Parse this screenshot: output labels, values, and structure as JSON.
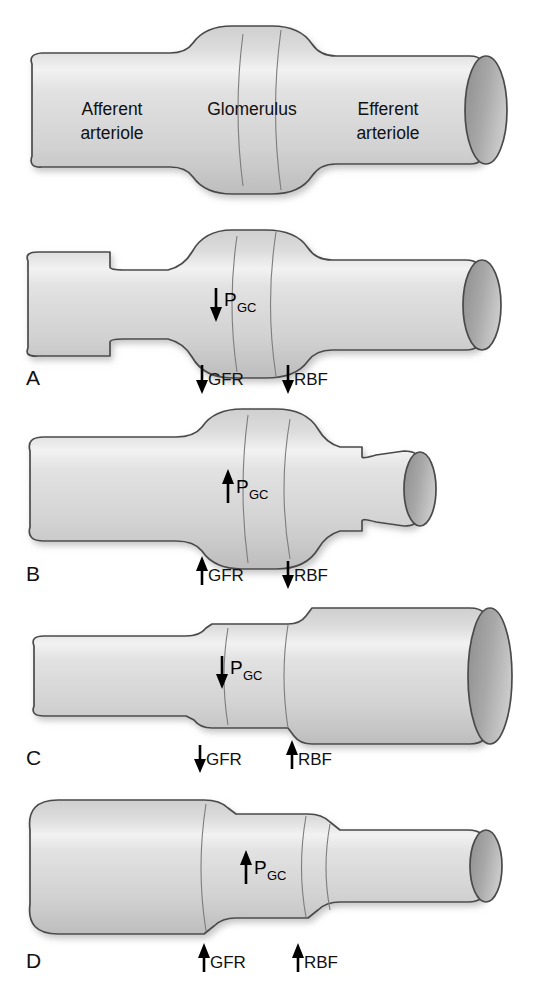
{
  "figure": {
    "background_color": "#ffffff",
    "vessel_fill_light": "#e6e6e6",
    "vessel_fill_mid": "#cfcfcf",
    "vessel_fill_dark": "#a9a9a9",
    "lumen_fill": "#9a9a9a",
    "outline_color": "#4a4a4a",
    "text_color": "#111111"
  },
  "top_panel": {
    "labels": {
      "afferent_line1": "Afferent",
      "afferent_line2": "arteriole",
      "glomerulus": "Glomerulus",
      "efferent_line1": "Efferent",
      "efferent_line2": "arteriole"
    }
  },
  "panels": [
    {
      "letter": "A",
      "condition": "afferent arteriolar constriction",
      "pgc": {
        "symbol": "P",
        "subscript": "GC",
        "direction": "down"
      },
      "gfr": {
        "label": "GFR",
        "direction": "down"
      },
      "rbf": {
        "label": "RBF",
        "direction": "down"
      }
    },
    {
      "letter": "B",
      "condition": "efferent arteriolar constriction",
      "pgc": {
        "symbol": "P",
        "subscript": "GC",
        "direction": "up"
      },
      "gfr": {
        "label": "GFR",
        "direction": "up"
      },
      "rbf": {
        "label": "RBF",
        "direction": "down"
      }
    },
    {
      "letter": "C",
      "condition": "efferent arteriolar dilation",
      "pgc": {
        "symbol": "P",
        "subscript": "GC",
        "direction": "down"
      },
      "gfr": {
        "label": "GFR",
        "direction": "down"
      },
      "rbf": {
        "label": "RBF",
        "direction": "up"
      }
    },
    {
      "letter": "D",
      "condition": "afferent arteriolar dilation",
      "pgc": {
        "symbol": "P",
        "subscript": "GC",
        "direction": "up"
      },
      "gfr": {
        "label": "GFR",
        "direction": "up"
      },
      "rbf": {
        "label": "RBF",
        "direction": "up"
      }
    }
  ]
}
